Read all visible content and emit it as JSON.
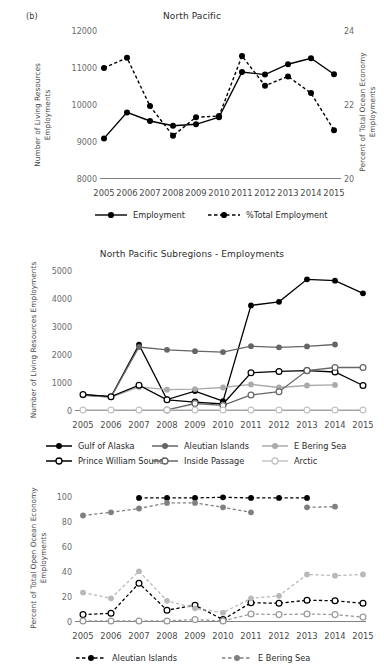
{
  "figure": {
    "panel_tag": "(b)"
  },
  "charts": [
    {
      "id": "north-pacific",
      "title": "North Pacific",
      "ylabel_left": "Number of Living Resources Employments",
      "ylabel_right": "Percent of Total Ocean Economy Employments",
      "ylabel_left_lines": [
        "Number of Living Resources",
        "Employments"
      ],
      "ylabel_right_lines": [
        "Percent of Total Ocean Economy",
        "Employments"
      ],
      "yticks_left": [
        "8000",
        "9000",
        "10000",
        "11000",
        "12000"
      ],
      "yticks_right": [
        "20",
        "22",
        "24"
      ],
      "xticks": [
        "2005",
        "2006",
        "2007",
        "2008",
        "2009",
        "2010",
        "2011",
        "2012",
        "2013",
        "2014",
        "2015"
      ],
      "legend": [
        {
          "label": "Employment",
          "style": "solid-filled",
          "color": "#000000"
        },
        {
          "label": "%Total Employment",
          "style": "dashed-filled",
          "color": "#000000"
        }
      ]
    },
    {
      "id": "north-pacific-subregions",
      "title": "North Pacific Subregions - Employments",
      "ylabel_left": "Number of Living Resources Employments",
      "ylabel_left_lines": [
        "Number of Living Resources Employments"
      ],
      "yticks_left": [
        "0",
        "1000",
        "2000",
        "3000",
        "4000",
        "5000"
      ],
      "xticks": [
        "2005",
        "2006",
        "2007",
        "2008",
        "2009",
        "2010",
        "2011",
        "2012",
        "2013",
        "2014",
        "2015"
      ],
      "legend": [
        {
          "label": "Gulf of Alaska",
          "style": "solid-filled",
          "color": "#000000"
        },
        {
          "label": "Aleutian Islands",
          "style": "solid-filled",
          "color": "#666666"
        },
        {
          "label": "E Bering Sea",
          "style": "solid-filled",
          "color": "#aaaaaa"
        },
        {
          "label": "Prince William Sound",
          "style": "solid-open",
          "color": "#000000"
        },
        {
          "label": "Inside Passage",
          "style": "solid-open",
          "color": "#666666"
        },
        {
          "label": "Arctic",
          "style": "solid-open",
          "color": "#c4c4c4"
        }
      ]
    },
    {
      "id": "north-pacific-percent",
      "title": "",
      "ylabel_left": "Percent of Total Open Ocean Economy Employments",
      "ylabel_left_lines": [
        "Percent of Total Open Ocean Economy",
        "Employments"
      ],
      "yticks_left": [
        "0",
        "20",
        "40",
        "60",
        "80",
        "100"
      ],
      "xticks": [
        "2005",
        "2006",
        "2007",
        "2008",
        "2009",
        "2010",
        "2011",
        "2012",
        "2013",
        "2014",
        "2015"
      ],
      "legend": [
        {
          "label": "Aleutian Islands",
          "style": "dashed-filled",
          "color": "#000000"
        },
        {
          "label": "E Bering Sea",
          "style": "dashed-filled",
          "color": "#808080"
        }
      ]
    }
  ],
  "chart_data": [
    {
      "type": "line",
      "title": "North Pacific",
      "xlabel": "",
      "ylabel": "Number of Living Resources Employments",
      "ylabel_secondary": "Percent of Total Ocean Economy Employments",
      "x": [
        2005,
        2006,
        2007,
        2008,
        2009,
        2010,
        2011,
        2012,
        2013,
        2014,
        2015
      ],
      "ylim": [
        8000,
        12000
      ],
      "ylim_secondary": [
        20,
        24
      ],
      "grid": false,
      "legend_position": "bottom",
      "series": [
        {
          "name": "Employment",
          "axis": "left",
          "style": "solid",
          "marker": "filled-circle",
          "color": "#000000",
          "values": [
            9080,
            9780,
            9550,
            9420,
            9460,
            9650,
            10870,
            10800,
            11080,
            11240,
            10810
          ]
        },
        {
          "name": "%Total Employment",
          "axis": "right",
          "style": "dashed",
          "marker": "filled-circle",
          "color": "#000000",
          "values": [
            22.98,
            23.25,
            21.95,
            21.15,
            21.65,
            21.68,
            23.3,
            22.5,
            22.75,
            22.3,
            21.3
          ]
        }
      ]
    },
    {
      "type": "line",
      "title": "North Pacific Subregions - Employments",
      "xlabel": "",
      "ylabel": "Number of Living Resources Employments",
      "x": [
        2005,
        2006,
        2007,
        2008,
        2009,
        2010,
        2011,
        2012,
        2013,
        2014,
        2015
      ],
      "ylim": [
        0,
        5000
      ],
      "grid": false,
      "legend_position": "bottom",
      "series": [
        {
          "name": "Gulf of Alaska",
          "style": "solid",
          "marker": "filled-circle",
          "color": "#000000",
          "values": [
            560,
            490,
            2340,
            390,
            690,
            330,
            3740,
            3870,
            4670,
            4620,
            4170
          ]
        },
        {
          "name": "Aleutian Islands",
          "style": "solid",
          "marker": "filled-circle",
          "color": "#666666",
          "values": [
            540,
            480,
            2260,
            2160,
            2110,
            2080,
            2290,
            2250,
            2280,
            2350,
            null
          ]
        },
        {
          "name": "E Bering Sea",
          "style": "solid",
          "marker": "filled-circle",
          "color": "#aaaaaa",
          "values": [
            560,
            470,
            840,
            740,
            760,
            820,
            930,
            820,
            890,
            910,
            null
          ]
        },
        {
          "name": "Prince William Sound",
          "style": "solid",
          "marker": "open-circle",
          "color": "#000000",
          "values": [
            570,
            490,
            900,
            380,
            300,
            230,
            1340,
            1390,
            1420,
            1370,
            890
          ]
        },
        {
          "name": "Inside Passage",
          "style": "solid",
          "marker": "open-circle",
          "color": "#666666",
          "values": [
            null,
            null,
            null,
            20,
            250,
            180,
            550,
            670,
            1420,
            1530,
            1530
          ]
        },
        {
          "name": "Arctic",
          "style": "solid",
          "marker": "open-circle",
          "color": "#c4c4c4",
          "values": [
            20,
            20,
            20,
            20,
            20,
            20,
            20,
            20,
            20,
            20,
            20
          ]
        }
      ]
    },
    {
      "type": "line",
      "title": "",
      "xlabel": "",
      "ylabel": "Percent of Total Open Ocean Economy Employments",
      "x": [
        2005,
        2006,
        2007,
        2008,
        2009,
        2010,
        2011,
        2012,
        2013,
        2014,
        2015
      ],
      "ylim": [
        0,
        100
      ],
      "grid": false,
      "legend_position": "bottom",
      "series": [
        {
          "name": "Aleutian Islands",
          "style": "dashed",
          "marker": "filled-circle",
          "color": "#000000",
          "values": [
            null,
            null,
            98.5,
            98.5,
            98.5,
            99,
            98.5,
            98.5,
            98.5,
            null,
            null
          ]
        },
        {
          "name": "E Bering Sea",
          "style": "dashed",
          "marker": "filled-circle",
          "color": "#808080",
          "values": [
            84.5,
            87,
            90,
            94.5,
            94.5,
            91,
            87,
            null,
            91,
            91.5,
            null
          ]
        },
        {
          "name": "Aleutian Islands (low)",
          "style": "dashed",
          "marker": "open-circle",
          "color": "#000000",
          "values": [
            5.5,
            6.5,
            30.5,
            9,
            13,
            1.5,
            15,
            14.5,
            17,
            16.5,
            14.5
          ]
        },
        {
          "name": "E Bering Sea (low)",
          "style": "dashed",
          "marker": "filled-circle",
          "color": "#b9b9b9",
          "values": [
            23,
            18.5,
            40,
            16.5,
            10.5,
            7,
            18.5,
            20.5,
            37.5,
            36.5,
            37.5
          ]
        },
        {
          "name": "Other (low open)",
          "style": "dashed",
          "marker": "open-circle",
          "color": "#9a9a9a",
          "values": [
            0.5,
            0.5,
            0.5,
            0.5,
            1.5,
            0.5,
            6,
            5.5,
            6,
            5.5,
            3.5
          ]
        }
      ]
    }
  ]
}
